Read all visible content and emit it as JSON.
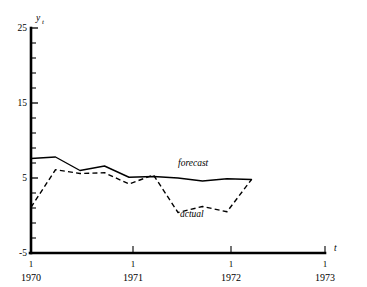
{
  "chart_data": {
    "type": "line",
    "title": "",
    "subtitle": "",
    "xlabel": "t",
    "ylabel": "y",
    "ylabel_sub": "t",
    "ylim": [
      -5,
      25
    ],
    "xlim": [
      1970.0,
      1973.0
    ],
    "grid": false,
    "legend_position": "inline-annotations",
    "y_ticks_major": [
      {
        "value": -5,
        "label": "-5"
      },
      {
        "value": 5,
        "label": "5"
      },
      {
        "value": 15,
        "label": "15"
      },
      {
        "value": 25,
        "label": "25"
      }
    ],
    "y_ticks_minor": [
      -3,
      -1,
      1,
      3,
      7,
      9,
      11,
      13,
      17,
      19,
      21,
      23
    ],
    "x_ticks": [
      {
        "value": 1970.0,
        "quarter": "1",
        "year": "1970"
      },
      {
        "value": 1971.0,
        "quarter": "1",
        "year": "1971"
      },
      {
        "value": 1972.0,
        "quarter": "1",
        "year": "1972"
      },
      {
        "value": 1973.0,
        "quarter": "1",
        "year": "1973"
      }
    ],
    "series": [
      {
        "name": "forecast",
        "style": "solid",
        "annotation": "forecast",
        "x": [
          1970.0,
          1970.25,
          1970.5,
          1970.75,
          1971.0,
          1971.25,
          1971.5,
          1971.75,
          1972.0,
          1972.25
        ],
        "values": [
          7.6,
          7.8,
          6.0,
          6.6,
          5.1,
          5.2,
          5.0,
          4.6,
          4.9,
          4.8
        ]
      },
      {
        "name": "actual",
        "style": "dashed",
        "annotation": "actual",
        "x": [
          1970.0,
          1970.25,
          1970.5,
          1970.75,
          1971.0,
          1971.25,
          1971.5,
          1971.75,
          1972.0,
          1972.25
        ],
        "values": [
          1.1,
          6.1,
          5.6,
          5.7,
          4.2,
          5.4,
          0.4,
          1.2,
          0.5,
          4.8
        ]
      }
    ],
    "annotations": [
      {
        "text": "forecast",
        "x": 1971.45,
        "y": 6.6
      },
      {
        "text": "actual",
        "x": 1971.55,
        "y": -1.5
      }
    ]
  }
}
